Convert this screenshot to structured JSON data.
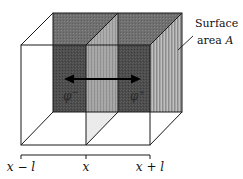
{
  "diagram": {
    "type": "3d-box-slab-diffusion",
    "labels": {
      "surface_line1": "Surface",
      "surface_line2": "area ",
      "surface_var": "A",
      "phi_minus": "φ",
      "phi_minus_sup": "−",
      "phi_plus": "φ",
      "phi_plus_sup": "+",
      "x_minus_l": "x − l",
      "x_center": "x",
      "x_plus_l": "x + l"
    },
    "colors": {
      "back_face": "#4a4a4a",
      "middle_plane": "#a8a8a8",
      "right_face": "#9a9a9a",
      "top_face": "#6a6a6a",
      "edges": "#1a1a1a",
      "arrow": "#000000",
      "background": "#ffffff"
    },
    "arrow": {
      "direction": "bidirectional",
      "meaning": "flux across surface A"
    }
  }
}
